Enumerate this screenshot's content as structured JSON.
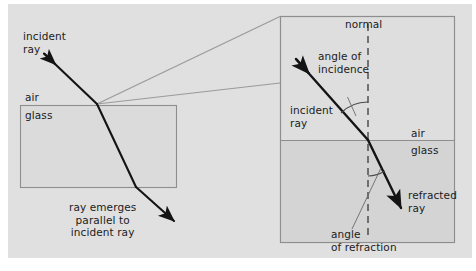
{
  "figure": {
    "type": "physics-ray-diagram",
    "background_color": "#e0e0e0",
    "ray_color": "#141414",
    "callout_color": "#8c8c8c",
    "frame_color": "#8e8e8e",
    "text_color": "#1b1b1b"
  },
  "left_panel": {
    "name": "overview-diagram",
    "labels": {
      "incident_ray": "incident\nray",
      "air": "air",
      "glass": "glass",
      "note": "ray emerges\nparallel to\nincident ray"
    },
    "block": {
      "material": "glass",
      "x": 20,
      "y": 105,
      "width": 156,
      "height": 82
    },
    "ray_path": {
      "entry_start": [
        44,
        54
      ],
      "surface_hit": [
        97,
        104
      ],
      "exit_point": [
        136,
        187
      ],
      "end": [
        178,
        225
      ]
    }
  },
  "right_panel": {
    "name": "magnified-detail",
    "labels": {
      "normal": "normal",
      "angle_of_incidence": "angle of\nincidence",
      "incident_ray": "incident\nray",
      "air": "air",
      "glass": "glass",
      "refracted_ray": "refracted\nray",
      "angle_of_refraction": "angle\nof refraction"
    },
    "frame": {
      "x": 280,
      "y": 16,
      "width": 175,
      "height": 227
    },
    "interface_y": 140,
    "normal_x": 368,
    "ray": {
      "incident_start": [
        297,
        60
      ],
      "interface_point": [
        368,
        140
      ],
      "refracted_end": [
        404,
        212
      ]
    }
  },
  "callout": {
    "name": "magnification-lines",
    "origin": [
      97,
      104
    ],
    "targets": [
      [
        280,
        16
      ],
      [
        280,
        83
      ]
    ]
  }
}
